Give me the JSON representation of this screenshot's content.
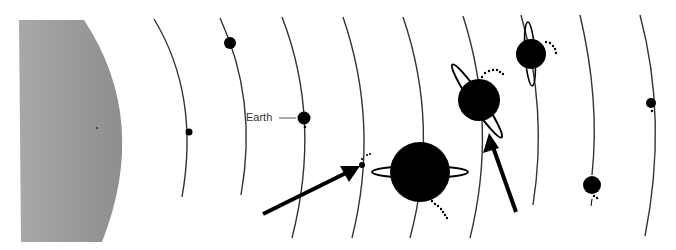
{
  "diagram": {
    "type": "solar-system-schematic",
    "colors": {
      "sun": "#9a9a9a",
      "planet": "#000000",
      "orbit": "#333333",
      "label": "#333333"
    },
    "labels": {
      "earth": "Earth"
    },
    "sun": {
      "name": "Sun"
    },
    "planets": [
      {
        "name": "Mercury",
        "cx": 189,
        "cy": 132,
        "r": 3.5
      },
      {
        "name": "Venus",
        "cx": 230,
        "cy": 43,
        "r": 6
      },
      {
        "name": "Earth",
        "cx": 304,
        "cy": 118,
        "r": 6.5
      },
      {
        "name": "Mars",
        "cx": 362,
        "cy": 165,
        "r": 3
      },
      {
        "name": "Jupiter",
        "cx": 420,
        "cy": 172,
        "r": 30
      },
      {
        "name": "Saturn",
        "cx": 479,
        "cy": 100,
        "r": 21
      },
      {
        "name": "Uranus",
        "cx": 531,
        "cy": 54,
        "r": 15
      },
      {
        "name": "Neptune",
        "cx": 592,
        "cy": 185,
        "r": 9
      },
      {
        "name": "Pluto",
        "cx": 651,
        "cy": 103,
        "r": 5
      }
    ],
    "arrows": [
      {
        "points_to": "Mars"
      },
      {
        "points_to": "Saturn"
      }
    ]
  }
}
